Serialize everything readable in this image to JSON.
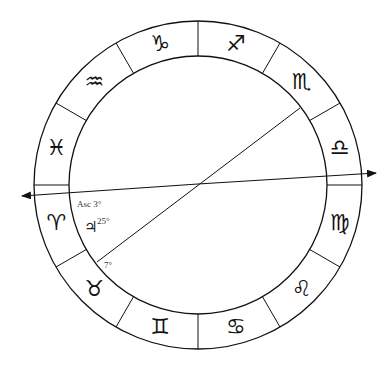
{
  "chart": {
    "center": [
      198,
      185
    ],
    "outer_radius": 164,
    "inner_radius": 129,
    "stroke_color": "#111111",
    "background": "#ffffff"
  },
  "signs": [
    {
      "name": "capricorn",
      "glyph": "♑",
      "angle": 105
    },
    {
      "name": "sagittarius",
      "glyph": "♐",
      "angle": 75
    },
    {
      "name": "scorpio",
      "glyph": "♏",
      "angle": 45
    },
    {
      "name": "libra",
      "glyph": "♎",
      "angle": 15
    },
    {
      "name": "virgo",
      "glyph": "♍",
      "angle": -15
    },
    {
      "name": "leo",
      "glyph": "♌",
      "angle": -45
    },
    {
      "name": "cancer",
      "glyph": "♋",
      "angle": -75
    },
    {
      "name": "gemini",
      "glyph": "♊",
      "angle": -105
    },
    {
      "name": "taurus",
      "glyph": "♉",
      "angle": -135
    },
    {
      "name": "aries",
      "glyph": "♈",
      "angle": -165
    },
    {
      "name": "pisces",
      "glyph": "♓",
      "angle": 165
    },
    {
      "name": "aquarius",
      "glyph": "♒",
      "angle": 135
    }
  ],
  "annotations": {
    "ascendant": "Asc 3°",
    "jupiter_glyph": "♃",
    "jupiter_degree": "25°",
    "line_degree": "7°"
  }
}
